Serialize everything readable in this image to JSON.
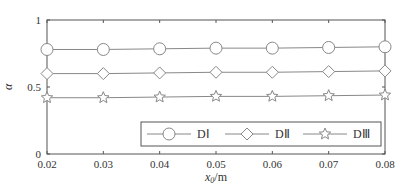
{
  "chart_data": {
    "type": "line",
    "title": "",
    "xlabel": "x0/m",
    "ylabel": "α",
    "xlim": [
      0.02,
      0.08
    ],
    "ylim": [
      0,
      1
    ],
    "x": [
      0.02,
      0.03,
      0.04,
      0.05,
      0.06,
      0.07,
      0.08
    ],
    "x_ticks": [
      "0.02",
      "0.03",
      "0.04",
      "0.05",
      "0.06",
      "0.07",
      "0.08"
    ],
    "y_ticks": [
      "0",
      "0.5",
      "1"
    ],
    "grid": false,
    "legend_position": "lower right",
    "series": [
      {
        "name": "DⅠ",
        "marker": "circle",
        "values": [
          0.78,
          0.78,
          0.785,
          0.79,
          0.79,
          0.795,
          0.8
        ]
      },
      {
        "name": "DⅡ",
        "marker": "diamond",
        "values": [
          0.6,
          0.6,
          0.605,
          0.61,
          0.61,
          0.615,
          0.62
        ]
      },
      {
        "name": "DⅢ",
        "marker": "star",
        "values": [
          0.42,
          0.42,
          0.425,
          0.43,
          0.43,
          0.435,
          0.44
        ]
      }
    ]
  },
  "axis": {
    "xlabel_main": "x",
    "xlabel_sub": "0",
    "xlabel_unit": "/m",
    "ylabel": "α"
  },
  "colors": {
    "line": "#888888",
    "axis": "#555555",
    "text": "#333333"
  }
}
